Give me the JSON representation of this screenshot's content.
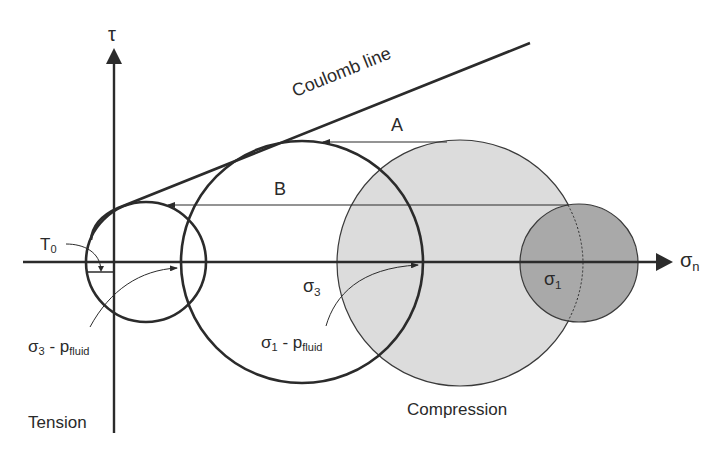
{
  "axes": {
    "y_label": "τ",
    "x_label_main": "σ",
    "x_label_sub": "n"
  },
  "labels": {
    "coulomb_line": "Coulomb line",
    "arrow_a": "A",
    "arrow_b": "B",
    "t0_main": "T",
    "t0_sub": "0",
    "sigma3_main": "σ",
    "sigma3_sub": "3",
    "sigma1_main": "σ",
    "sigma1_sub": "1",
    "s3pf_main": "σ",
    "s3pf_sub1": "3",
    "s3pf_mid": " - p",
    "s3pf_sub2": "fluid",
    "s1pf_main": "σ",
    "s1pf_sub1": "1",
    "s1pf_mid": " - p",
    "s1pf_sub2": "fluid",
    "tension": "Tension",
    "compression": "Compression"
  },
  "colors": {
    "stroke": "#2b2b2b",
    "light_circle_fill": "#dcdcdc",
    "dark_circle_fill": "#a9a9a9",
    "text": "#2a2a2a"
  },
  "geometry": {
    "origin": [
      114,
      262
    ],
    "circles": [
      {
        "name": "small-circle",
        "cx": 146,
        "cy": 262,
        "r": 60,
        "fill": "none"
      },
      {
        "name": "large-open-circle",
        "cx": 302,
        "cy": 262,
        "r": 121,
        "fill": "none"
      },
      {
        "name": "light-gray-circle",
        "cx": 460,
        "cy": 263,
        "r": 123,
        "fill": "#dcdcdc"
      },
      {
        "name": "dark-gray-circle",
        "cx": 579,
        "cy": 263,
        "r": 59,
        "fill": "#a9a9a9"
      }
    ],
    "coulomb_line": {
      "from": [
        92,
        222
      ],
      "to": [
        530,
        43
      ]
    },
    "arrow_a": {
      "y": 142,
      "from_x": 447,
      "to_x": 323
    },
    "arrow_b": {
      "y": 205,
      "from_x": 568,
      "to_x": 168
    }
  }
}
